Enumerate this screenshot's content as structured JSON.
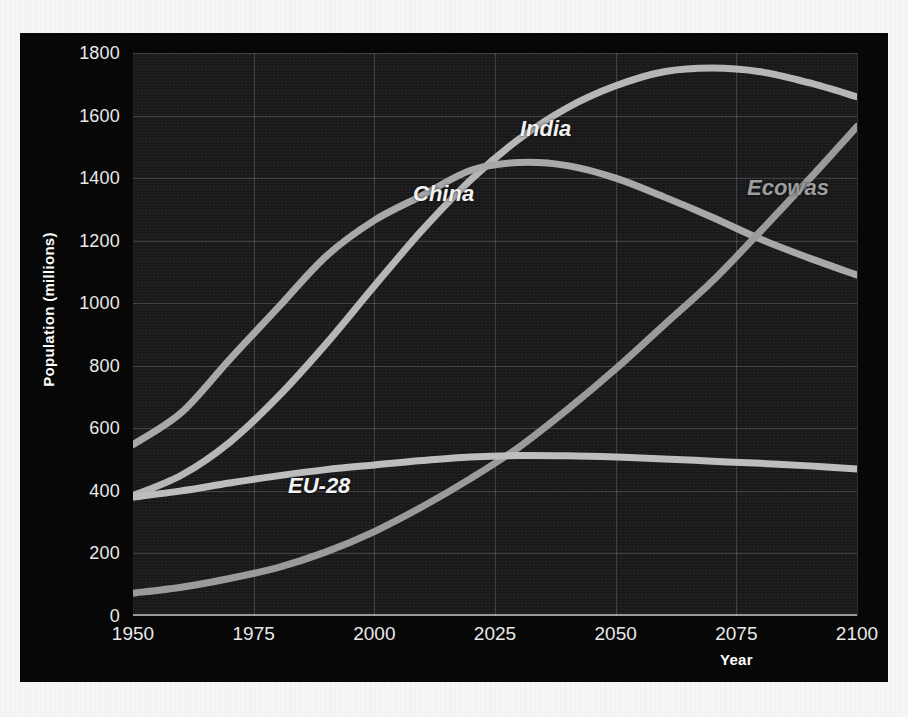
{
  "chart_data": {
    "type": "line",
    "title": "",
    "xlabel": "Year",
    "ylabel": "Population (millions)",
    "xlim": [
      1950,
      2100
    ],
    "ylim": [
      0,
      1800
    ],
    "grid": true,
    "legend_position": "inline-labels",
    "background_color": "#17171a",
    "panel_color": "#060606",
    "x_ticks": [
      "1950",
      "1975",
      "2000",
      "2025",
      "2050",
      "2075",
      "2100"
    ],
    "y_ticks": [
      "0",
      "200",
      "400",
      "600",
      "800",
      "1000",
      "1200",
      "1400",
      "1600",
      "1800"
    ],
    "x": [
      1950,
      1960,
      1970,
      1980,
      1990,
      2000,
      2010,
      2020,
      2030,
      2040,
      2050,
      2060,
      2070,
      2080,
      2090,
      2100
    ],
    "series": [
      {
        "name": "India",
        "label": "India",
        "color": "#b6b6b6",
        "label_color": "#f2f2f2",
        "label_x": 500,
        "label_y": 83,
        "values": [
          385,
          450,
          555,
          700,
          870,
          1055,
          1235,
          1395,
          1525,
          1625,
          1695,
          1740,
          1752,
          1740,
          1705,
          1660
        ]
      },
      {
        "name": "China",
        "label": "China",
        "color": "#a8a8a8",
        "label_color": "#f2f2f2",
        "label_x": 393,
        "label_y": 148,
        "values": [
          548,
          650,
          820,
          985,
          1150,
          1265,
          1345,
          1425,
          1450,
          1440,
          1400,
          1340,
          1275,
          1205,
          1145,
          1090
        ]
      },
      {
        "name": "Ecowas",
        "label": "Ecowas",
        "color": "#9a9a9a",
        "label_color": "#9d9d9d",
        "label_x": 727,
        "label_y": 142,
        "values": [
          73,
          92,
          120,
          155,
          205,
          270,
          350,
          440,
          540,
          660,
          790,
          930,
          1070,
          1230,
          1395,
          1565
        ]
      },
      {
        "name": "EU-28",
        "label": "EU-28",
        "color": "#bdbdbd",
        "label_color": "#f2f2f2",
        "label_x": 268,
        "label_y": 440,
        "values": [
          380,
          400,
          425,
          448,
          468,
          483,
          497,
          508,
          513,
          512,
          508,
          502,
          495,
          488,
          480,
          470
        ]
      }
    ]
  },
  "axes": {
    "y_title": "Population (millions)",
    "x_title": "Year"
  }
}
